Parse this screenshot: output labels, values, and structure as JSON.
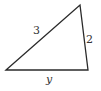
{
  "diagram": {
    "type": "triangle",
    "stroke_color": "#2a2a2a",
    "vertices": {
      "bottom_left": [
        6,
        70
      ],
      "top": [
        80,
        5
      ],
      "bottom_right": [
        88,
        70
      ]
    },
    "labels": {
      "left_side": "3",
      "right_side": "2",
      "bottom_side": "y"
    }
  }
}
